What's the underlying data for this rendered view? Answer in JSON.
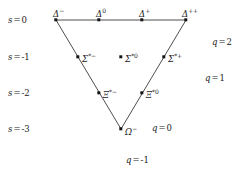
{
  "figure": {
    "background_color": "#ffffff",
    "line_color": "#3a3a3a",
    "node_color": "#141414"
  },
  "chart_data": {
    "type": "scatter",
    "title": "",
    "xlabel": "q",
    "ylabel": "s",
    "grid": false,
    "legend": null,
    "axis_notes": {
      "strangeness_rows": [
        "s = 0",
        "s = -1",
        "s = -2",
        "s = -3"
      ],
      "charge_diagonals": [
        "q = 2",
        "q = 1",
        "q = 0",
        "q = -1"
      ]
    },
    "categories": [
      "s = 0",
      "s = -1",
      "s = -2",
      "s = -3"
    ],
    "points": [
      {
        "label": "Δ",
        "sup": "−",
        "x": 56,
        "y": 20,
        "s": 0,
        "q": -1,
        "label_dx": -3,
        "label_dy": -13,
        "label_align": "left"
      },
      {
        "label": "Δ",
        "sup": "0",
        "x": 99,
        "y": 20,
        "s": 0,
        "q": 0,
        "label_dx": -3,
        "label_dy": -13,
        "label_align": "left"
      },
      {
        "label": "Δ",
        "sup": "+",
        "x": 142,
        "y": 20,
        "s": 0,
        "q": 1,
        "label_dx": -3,
        "label_dy": -13,
        "label_align": "left"
      },
      {
        "label": "Δ",
        "sup": "++",
        "x": 186,
        "y": 20,
        "s": 0,
        "q": 2,
        "label_dx": -4,
        "label_dy": -13,
        "label_align": "left"
      },
      {
        "label": "Σ",
        "sup": "*−",
        "x": 78,
        "y": 57,
        "s": -1,
        "q": -1,
        "label_dx": 4,
        "label_dy": -5,
        "label_align": "left"
      },
      {
        "label": "Σ",
        "sup": "*0",
        "x": 121,
        "y": 57,
        "s": -1,
        "q": 0,
        "label_dx": 4,
        "label_dy": -5,
        "label_align": "left"
      },
      {
        "label": "Σ",
        "sup": "*+",
        "x": 164,
        "y": 57,
        "s": -1,
        "q": 1,
        "label_dx": 4,
        "label_dy": -5,
        "label_align": "left"
      },
      {
        "label": "Ξ",
        "sup": "*−",
        "x": 99,
        "y": 93,
        "s": -2,
        "q": -1,
        "label_dx": 4,
        "label_dy": -5,
        "label_align": "left"
      },
      {
        "label": "Ξ",
        "sup": "*0",
        "x": 142,
        "y": 93,
        "s": -2,
        "q": 0,
        "label_dx": 4,
        "label_dy": -5,
        "label_align": "left"
      },
      {
        "label": "Ω",
        "sup": "−",
        "x": 121,
        "y": 129,
        "s": -3,
        "q": -1,
        "label_dx": 4,
        "label_dy": -4,
        "label_align": "left"
      }
    ],
    "edges": [
      {
        "name": "top-edge",
        "x1": 56,
        "y1": 20,
        "x2": 186,
        "y2": 20
      },
      {
        "name": "left-edge",
        "x1": 56,
        "y1": 20,
        "x2": 121,
        "y2": 129
      },
      {
        "name": "right-edge",
        "x1": 186,
        "y1": 20,
        "x2": 121,
        "y2": 129
      }
    ],
    "strangeness_labels": [
      {
        "var": "s",
        "eq": "=",
        "value": "0",
        "x": 8,
        "y": 20
      },
      {
        "var": "s",
        "eq": "=",
        "value": "-1",
        "x": 8,
        "y": 57
      },
      {
        "var": "s",
        "eq": "=",
        "value": "-2",
        "x": 8,
        "y": 93
      },
      {
        "var": "s",
        "eq": "=",
        "value": "-3",
        "x": 8,
        "y": 129
      }
    ],
    "charge_labels": [
      {
        "var": "q",
        "eq": "=",
        "value": "2",
        "x": 212,
        "y": 42
      },
      {
        "var": "q",
        "eq": "=",
        "value": "1",
        "x": 205,
        "y": 78
      },
      {
        "var": "q",
        "eq": "=",
        "value": "0",
        "x": 152,
        "y": 128
      },
      {
        "var": "q",
        "eq": "=",
        "value": "-1",
        "x": 126,
        "y": 160
      }
    ]
  }
}
